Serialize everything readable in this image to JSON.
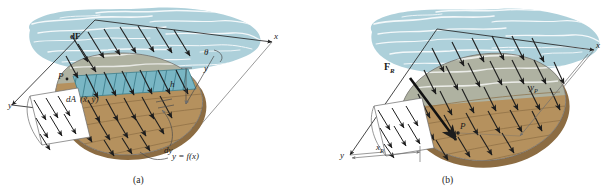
{
  "figure": {
    "colors": {
      "water_fill": "#a9ced8",
      "water_wave": "#ffffff",
      "plate_brown": "#b5915f",
      "plate_brown_dark": "#8c6c42",
      "strip_teal": "#79b6c4",
      "line": "#2b2b2b",
      "thin_line": "#8a8a8a",
      "page_bg": "#ffffff"
    }
  },
  "panel_a": {
    "caption": "(a)",
    "labels": {
      "axis_x": "x",
      "axis_y": "y",
      "axis_y_inclined": "y",
      "force_dF": "dF",
      "point_P": "P",
      "area_dA": "dA",
      "area_centroid": "(x̃, ỹ)",
      "depth_h": "h",
      "thickness_dy": "dy",
      "angle_theta": "θ",
      "curve_equation": "y = f(x)"
    }
  },
  "panel_b": {
    "caption": "(b)",
    "labels": {
      "axis_x": "x",
      "axis_y": "y",
      "resultant_force": "F",
      "resultant_force_sub": "R",
      "point_P": "P",
      "dim_xP": "x",
      "dim_xP_sub": "P",
      "dim_yP": "y",
      "dim_yP_sub": "P"
    }
  }
}
